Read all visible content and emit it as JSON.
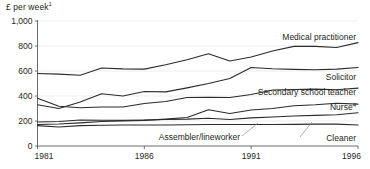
{
  "chart_data": {
    "type": "line",
    "title": "",
    "ylabel": "£ per week",
    "ylabel_superscript": "1",
    "xlabel": "",
    "ylim": [
      0,
      1000
    ],
    "xlim": [
      1981,
      1996
    ],
    "grid": true,
    "legend_position": "inline-right",
    "y_ticks": [
      "0",
      "200",
      "400",
      "600",
      "800",
      "1,000"
    ],
    "y_tick_values": [
      0,
      200,
      400,
      600,
      800,
      1000
    ],
    "x_ticks": [
      "1981",
      "1986",
      "1991",
      "1996"
    ],
    "x_tick_values": [
      1981,
      1986,
      1991,
      1996
    ],
    "x": [
      1981,
      1982,
      1983,
      1984,
      1985,
      1986,
      1987,
      1988,
      1989,
      1990,
      1991,
      1992,
      1993,
      1994,
      1995,
      1996
    ],
    "series": [
      {
        "name": "Medical practitioner",
        "label": "Medical practitioner",
        "superscript": "",
        "values": [
          580,
          575,
          566,
          624,
          617,
          615,
          650,
          690,
          738,
          680,
          712,
          760,
          797,
          797,
          788,
          827
        ]
      },
      {
        "name": "Solicitor",
        "label": "Solicitor",
        "superscript": "",
        "values": [
          330,
          300,
          352,
          418,
          400,
          436,
          433,
          465,
          500,
          540,
          628,
          618,
          613,
          610,
          615,
          628
        ]
      },
      {
        "name": "Secondary school teacher",
        "label": "Secondary school teacher",
        "superscript": "",
        "values": [
          382,
          318,
          306,
          312,
          312,
          340,
          356,
          388,
          390,
          388,
          412,
          448,
          452,
          455,
          450,
          463
        ]
      },
      {
        "name": "Nurse",
        "label": "Nurse",
        "superscript": "4",
        "values": [
          172,
          176,
          185,
          196,
          200,
          205,
          215,
          228,
          290,
          260,
          288,
          300,
          322,
          330,
          342,
          335
        ]
      },
      {
        "name": "Assembler/lineworker",
        "label": "Assembler/lineworker",
        "superscript": "",
        "values": [
          192,
          196,
          208,
          206,
          205,
          208,
          212,
          215,
          222,
          212,
          225,
          232,
          240,
          245,
          250,
          266
        ]
      },
      {
        "name": "Cleaner",
        "label": "Cleaner",
        "superscript": "",
        "values": [
          163,
          152,
          163,
          166,
          168,
          168,
          168,
          170,
          172,
          172,
          172,
          172,
          173,
          175,
          175,
          168
        ]
      }
    ],
    "colors": {
      "line": "#2b2b2b",
      "axis": "#6f6c68",
      "grid": "#e9e7e4",
      "text": "#231f20"
    }
  }
}
